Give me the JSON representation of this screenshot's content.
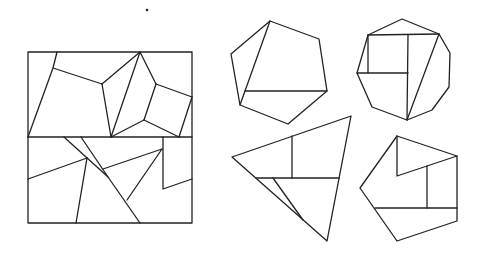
{
  "figure": {
    "stroke_color": "#222222",
    "background": "#ffffff",
    "dot": {
      "cx": 147,
      "cy": 10,
      "r": 1.3
    },
    "shapes": [
      {
        "name": "square",
        "outline": "28,52 192,52 192,223 28,223",
        "cuts": [
          "28,137 192,137",
          "57,52 53,68 28,137",
          "53,68 102,84",
          "102,84 140,52",
          "102,84 111,137",
          "140,52 111,137",
          "140,52 156,84",
          "156,84 192,97",
          "192,97 179,137",
          "156,84 144,120",
          "144,120 111,137",
          "144,120 179,137",
          "64,137 108,177 140,223",
          "81,137 108,177",
          "28,179 87,158",
          "87,158 76,223",
          "103,169 162,149",
          "162,149 127,200",
          "163,137 163,189 192,179"
        ]
      },
      {
        "name": "heptagon",
        "outline": "270,21 319,39 327,91 288,124 240,105 231,54",
        "cuts": [
          "270,21 240,105",
          "245,91 327,91"
        ]
      },
      {
        "name": "octagon",
        "outline": "402,19 439,34 450,53 449,87 432,110 407,120 372,107 357,73 368,35",
        "cuts": [
          "368,35 439,34",
          "408,35 407,120",
          "368,35 368,73",
          "357,73 408,73",
          "439,34 407,120"
        ]
      },
      {
        "name": "triangle",
        "outline": "232,157 351,116 327,241",
        "cuts": [
          "292,136 292,178",
          "256,178 339,178",
          "273,178 303,220"
        ]
      },
      {
        "name": "pentagon",
        "outline": "397,136 457,156 457,221 397,241 360,188",
        "cuts": [
          "397,136 397,176 457,156",
          "427,166 427,208",
          "375,208 457,208"
        ]
      }
    ]
  }
}
